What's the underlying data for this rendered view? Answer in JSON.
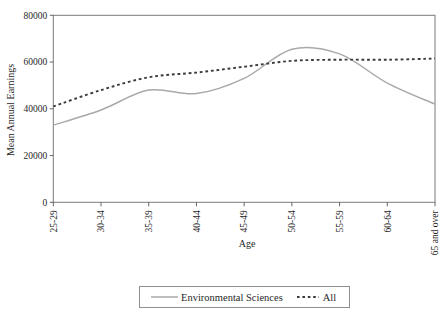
{
  "chart": {
    "y_axis_title": "Mean Annual Earnings",
    "x_axis_title": "Age",
    "legend": {
      "series1": "Environmental Sciences",
      "series2": "All"
    },
    "colors": {
      "env_sciences_line": "#a9a9a9",
      "all_line": "#3b3b3b",
      "axis": "#7a7a7a",
      "text": "#1f1f1f",
      "background": "#ffffff"
    }
  },
  "chart_data": {
    "type": "line",
    "title": "",
    "xlabel": "Age",
    "ylabel": "Mean Annual Earnings",
    "categories": [
      "25-29",
      "30-34",
      "35-39",
      "40-44",
      "45-49",
      "50-54",
      "55-59",
      "60-64",
      "65 and over"
    ],
    "series": [
      {
        "name": "Environmental Sciences",
        "style": "solid",
        "color": "#a9a9a9",
        "values": [
          33000,
          39500,
          48000,
          46500,
          53000,
          65500,
          63500,
          51000,
          42000
        ]
      },
      {
        "name": "All",
        "style": "dashed",
        "color": "#3b3b3b",
        "values": [
          41000,
          48000,
          53500,
          55500,
          58000,
          60500,
          61000,
          61000,
          61500
        ]
      }
    ],
    "ylim": [
      0,
      80000
    ],
    "ytick_step": 20000,
    "ytick_labels": [
      "0",
      "20000",
      "40000",
      "60000",
      "80000"
    ],
    "grid": false,
    "curve": "smooth",
    "legend_position": "bottom",
    "x_tick_label_rotation_deg": 90
  }
}
